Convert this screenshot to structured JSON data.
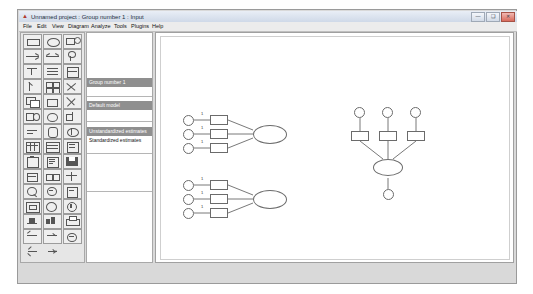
{
  "window": {
    "title": "Unnamed project : Group number 1 : Input",
    "icon": "amos-app-icon",
    "buttons": {
      "minimize": "—",
      "maximize": "❑",
      "close": "✕"
    }
  },
  "menu": {
    "items": [
      "File",
      "Edit",
      "View",
      "Diagram",
      "Analyze",
      "Tools",
      "Plugins",
      "Help"
    ]
  },
  "models": {
    "group_header": "Group number 1",
    "model_header": "Default model",
    "estimates_header": "Unstandardized estimates",
    "estimates_item": "Standardized estimates"
  },
  "toolbox": {
    "tools": [
      "rectangle-tool",
      "ellipse-tool",
      "observed-variable-tool",
      "path-tool",
      "covariance-tool",
      "error-variable-tool",
      "title-tool",
      "list-variables-tool",
      "variables-in-model-tool",
      "select-one-tool",
      "select-all-tool",
      "deselect-all-tool",
      "duplicate-tool",
      "move-tool",
      "erase-tool",
      "change-shape-tool",
      "rotate-tool",
      "reflect-tool",
      "move-parameter-tool",
      "scroll-tool",
      "touch-up-tool",
      "data-files-tool",
      "analysis-properties-tool",
      "calculate-estimates-tool",
      "copy-clipboard-tool",
      "text-output-tool",
      "save-tool",
      "object-properties-tool",
      "drag-properties-tool",
      "preserve-symmetry-tool",
      "zoom-in-tool",
      "zoom-out-tool",
      "zoom-page-tool",
      "fit-to-page-tool",
      "magnify-tool",
      "loupe-tool",
      "bayesian-tool",
      "multiple-group-tool",
      "print-tool",
      "undo-tool",
      "redo-tool",
      "specification-search-tool",
      "back-tool",
      "forward-tool",
      "blank-tool"
    ]
  },
  "canvas": {
    "diagram_label": "1",
    "models": [
      {
        "name": "measurement-model-top-left",
        "indicator_labels": [
          "1",
          "1",
          "1"
        ]
      },
      {
        "name": "measurement-model-bottom-left",
        "indicator_labels": [
          "1",
          "1",
          "1"
        ]
      },
      {
        "name": "formative-model-right",
        "indicator_labels": [
          "",
          "",
          ""
        ]
      }
    ]
  },
  "status": {
    "text": ""
  }
}
